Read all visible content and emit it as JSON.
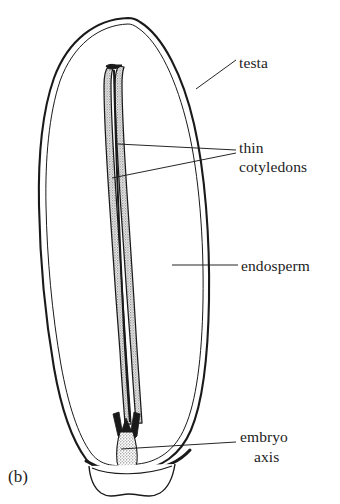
{
  "figure": {
    "caption": "(b)",
    "background_color": "#ffffff",
    "ink_color": "#1a1a1a",
    "stipple_color": "#9a9a9a"
  },
  "labels": [
    {
      "id": "testa",
      "text": "testa",
      "x": 239,
      "y": 53
    },
    {
      "id": "thin",
      "text": "thin",
      "x": 239,
      "y": 138
    },
    {
      "id": "cotyledons",
      "text": "cotyledons",
      "x": 239,
      "y": 157
    },
    {
      "id": "endosperm",
      "text": "endosperm",
      "x": 241,
      "y": 256
    },
    {
      "id": "embryo",
      "text": "embryo",
      "x": 240,
      "y": 427
    },
    {
      "id": "axis",
      "text": "axis",
      "x": 254,
      "y": 447
    }
  ],
  "structures": [
    {
      "id": "testa",
      "name": "testa",
      "description": "outer seed coat, double outline"
    },
    {
      "id": "endosperm",
      "name": "endosperm",
      "description": "nutritive tissue filling seed body"
    },
    {
      "id": "cotyledons",
      "name": "thin cotyledons",
      "description": "two narrow stippled strips"
    },
    {
      "id": "embryo-axis",
      "name": "embryo axis",
      "description": "stippled region at seed base"
    },
    {
      "id": "basal-appendage",
      "name": "basal appendage",
      "description": "wavy structure below seed base"
    }
  ]
}
